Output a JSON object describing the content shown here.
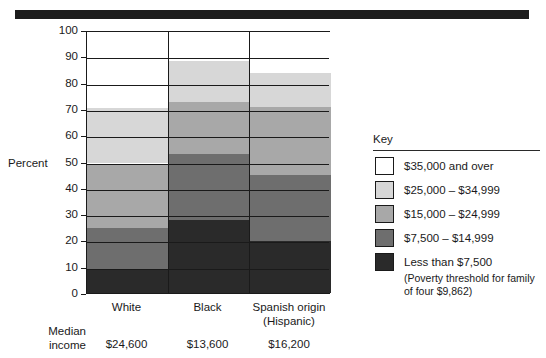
{
  "chart_data": {
    "type": "bar",
    "subtype": "stacked-100-percent",
    "title": "",
    "xlabel": "",
    "ylabel": "Percent",
    "ylim": [
      0,
      100
    ],
    "yticks": [
      0,
      10,
      20,
      30,
      40,
      50,
      60,
      70,
      80,
      90,
      100
    ],
    "grid": true,
    "legend_position": "right",
    "categories": [
      "White",
      "Black",
      "Spanish origin (Hispanic)"
    ],
    "category_lines": [
      [
        "White",
        ""
      ],
      [
        "Black",
        ""
      ],
      [
        "Spanish origin",
        "(Hispanic)"
      ]
    ],
    "series": [
      {
        "name": "Less than $7,500",
        "color": "#2a2a2a",
        "values": [
          10.0,
          28.5,
          20.5
        ]
      },
      {
        "name": "$7,500 - $14,999",
        "color": "#6e6e6e",
        "values": [
          15.5,
          25.0,
          25.0
        ]
      },
      {
        "name": "$15,000 - $24,999",
        "color": "#a8a8a8",
        "values": [
          24.5,
          20.0,
          26.0
        ]
      },
      {
        "name": "$25,000 - $34,999",
        "color": "#d7d7d7",
        "values": [
          21.0,
          15.5,
          13.0
        ]
      },
      {
        "name": "$35,000 and over",
        "color": "#ffffff",
        "values": [
          29.0,
          11.0,
          15.5
        ]
      }
    ],
    "cumulative_tops": {
      "White": [
        10.0,
        25.5,
        50.0,
        71.0,
        100
      ],
      "Black": [
        28.5,
        53.5,
        73.5,
        89.0,
        100
      ],
      "Spanish origin (Hispanic)": [
        20.5,
        45.5,
        71.5,
        84.5,
        100
      ]
    },
    "annotations": {
      "median_income_label": "Median income",
      "median_income_values": [
        "$24,600",
        "$13,600",
        "$16,200"
      ],
      "poverty_note": "(Poverty threshold for family of four $9,862)"
    }
  },
  "axis": {
    "y_label": "Percent",
    "y_ticks": [
      "100",
      "90",
      "80",
      "70",
      "60",
      "50",
      "40",
      "30",
      "20",
      "10",
      "0"
    ]
  },
  "x_axis": {
    "labels": [
      {
        "line1": "White",
        "line2": ""
      },
      {
        "line1": "Black",
        "line2": ""
      },
      {
        "line1": "Spanish origin",
        "line2": "(Hispanic)"
      }
    ]
  },
  "median_row": {
    "label_line1": "Median",
    "label_line2": "income",
    "values": [
      "$24,600",
      "$13,600",
      "$16,200"
    ]
  },
  "key": {
    "title": "Key",
    "items": [
      {
        "label": "$35,000 and over",
        "color": "#ffffff"
      },
      {
        "label": "$25,000 – $34,999",
        "color": "#d7d7d7"
      },
      {
        "label": "$15,000 – $24,999",
        "color": "#a8a8a8"
      },
      {
        "label": "$7,500 – $14,999",
        "color": "#6e6e6e"
      },
      {
        "label": "Less than $7,500",
        "color": "#2a2a2a"
      }
    ],
    "note_line1": "(Poverty threshold for family",
    "note_line2": "of four $9,862)"
  },
  "colors": {
    "ink": "#1a1a1a",
    "rule": "#1c1c1c"
  }
}
